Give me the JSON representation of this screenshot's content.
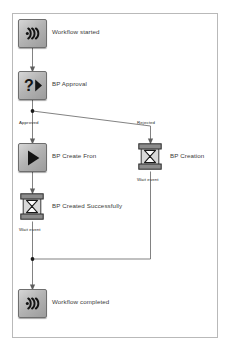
{
  "diagram": {
    "canvas": {
      "background": "#ffffff",
      "border_color": "#b9b9b9"
    },
    "nodes": [
      {
        "id": "start",
        "label": "Workflow started",
        "icon": "broadcast-signal-icon",
        "x": 18,
        "y": 18
      },
      {
        "id": "approval",
        "label": "BP Approval",
        "icon": "question-play-icon",
        "x": 18,
        "y": 70
      },
      {
        "id": "createfrom",
        "label": "BP Create Fron",
        "icon": "play-triangle-icon",
        "x": 18,
        "y": 142
      },
      {
        "id": "creation",
        "label": "BP Creation",
        "icon": "hourglass-wait-icon",
        "x": 136,
        "y": 142
      },
      {
        "id": "created",
        "label": "BP Created Successfully",
        "icon": "hourglass-wait-icon",
        "x": 18,
        "y": 192
      },
      {
        "id": "end",
        "label": "Workflow completed",
        "icon": "broadcast-signal-icon",
        "x": 18,
        "y": 288
      }
    ],
    "edge_labels": [
      {
        "id": "approved",
        "text": "Approved",
        "x": 19,
        "y": 120
      },
      {
        "id": "rejected",
        "text": "Rejected",
        "x": 138,
        "y": 120
      },
      {
        "id": "waitevent1",
        "text": "Wait event",
        "x": 138,
        "y": 176
      },
      {
        "id": "waitevent2",
        "text": "Wait event",
        "x": 19,
        "y": 226
      }
    ],
    "edge_color": "#6b6b6b",
    "junction_color": "#1a1a1a"
  }
}
